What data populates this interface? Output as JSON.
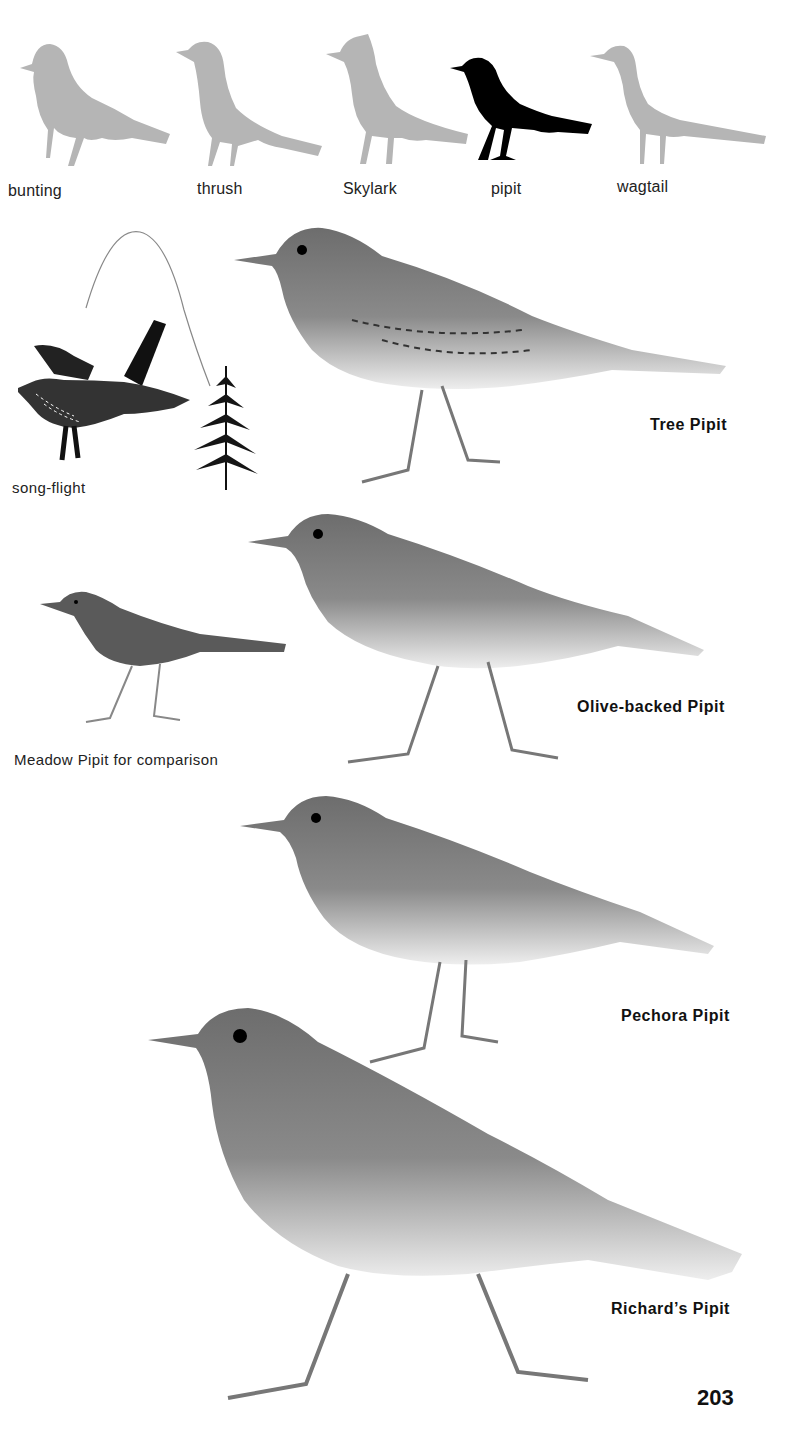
{
  "silhouettes": [
    {
      "label": "bunting",
      "highlight": false
    },
    {
      "label": "thrush",
      "highlight": false
    },
    {
      "label": "Skylark",
      "highlight": false
    },
    {
      "label": "pipit",
      "highlight": true
    },
    {
      "label": "wagtail",
      "highlight": false
    }
  ],
  "colors": {
    "silhouette_muted": "#b5b5b5",
    "silhouette_highlight": "#000000",
    "text": "#111111"
  },
  "captions": {
    "song_flight": "song-flight",
    "meadow_comparison": "Meadow Pipit for comparison"
  },
  "species": [
    {
      "name": "Tree Pipit"
    },
    {
      "name": "Olive-backed Pipit"
    },
    {
      "name": "Pechora Pipit"
    },
    {
      "name": "Richard’s Pipit"
    }
  ],
  "page_number": "203"
}
